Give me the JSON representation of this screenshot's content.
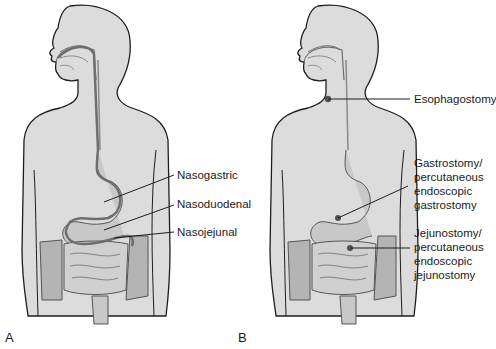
{
  "figure": {
    "panels": [
      {
        "letter": "A",
        "labels": [
          {
            "text": "Nasogastric"
          },
          {
            "text": "Nasoduodenal"
          },
          {
            "text": "Nasojejunal"
          }
        ]
      },
      {
        "letter": "B",
        "labels": [
          {
            "text": "Esophagostomy"
          },
          {
            "text": "Gastrostomy/\npercutaneous\nendoscopic\ngastrostomy"
          },
          {
            "text": "Jejunostomy/\npercutaneous\nendoscopic\njejunostomy"
          }
        ]
      }
    ],
    "colors": {
      "body_fill": "#dcdcdc",
      "outline": "#1e1e1e",
      "organ_fill": "#c8c8c8",
      "tube": "#6e6e6e",
      "colon_fill": "#b4b4b4",
      "stoma": "#505050"
    }
  }
}
